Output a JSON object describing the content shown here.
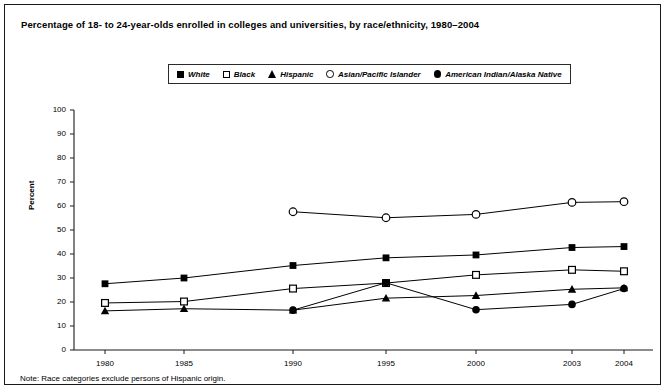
{
  "figure": {
    "title": "Percentage of 18- to 24-year-olds enrolled in colleges and universities, by race/ethnicity, 1980–2004",
    "note": "Note: Race categories exclude persons of Hispanic origin."
  },
  "legend": {
    "position": "top-center",
    "items": [
      {
        "label": "White",
        "marker": "filled-square-icon"
      },
      {
        "label": "Black",
        "marker": "open-square-icon"
      },
      {
        "label": "Hispanic",
        "marker": "filled-triangle-icon"
      },
      {
        "label": "Asian/Pacific Islander",
        "marker": "open-circle-icon"
      },
      {
        "label": "American Indian/Alaska Native",
        "marker": "filled-circle-icon"
      }
    ]
  },
  "axes": {
    "y_label": "Percent",
    "y_ticks": [
      "100",
      "90",
      "80",
      "70",
      "60",
      "50",
      "40",
      "30",
      "20",
      "10",
      "0"
    ],
    "x_ticks": [
      "1980",
      "1985",
      "1990",
      "1995",
      "2000",
      "2003",
      "2004"
    ]
  },
  "chart_data": {
    "type": "line",
    "title": "Percentage of 18- to 24-year-olds enrolled in colleges and universities, by race/ethnicity, 1980–2004",
    "xlabel": "",
    "ylabel": "Percent",
    "x": [
      1980,
      1985,
      1990,
      1995,
      2000,
      2003,
      2004
    ],
    "xlim": [
      1978,
      2005
    ],
    "ylim": [
      0,
      100
    ],
    "ytick_step": 10,
    "grid": false,
    "legend_position": "top-center",
    "annotations": [
      "Note: Race categories exclude persons of Hispanic origin."
    ],
    "series": [
      {
        "name": "White",
        "marker": "filled-square",
        "color": "#000000",
        "x": [
          1980,
          1985,
          1990,
          1995,
          2000,
          2003,
          2004
        ],
        "values": [
          27.6,
          30.0,
          35.2,
          38.4,
          39.6,
          42.7,
          43.1
        ]
      },
      {
        "name": "Black",
        "marker": "open-square",
        "color": "#000000",
        "x": [
          1980,
          1985,
          1990,
          1995,
          2000,
          2003,
          2004
        ],
        "values": [
          19.6,
          20.2,
          25.6,
          27.9,
          31.3,
          33.4,
          32.8
        ]
      },
      {
        "name": "Hispanic",
        "marker": "filled-triangle",
        "color": "#000000",
        "x": [
          1980,
          1985,
          1990,
          1995,
          2000,
          2003,
          2004
        ],
        "values": [
          16.3,
          17.2,
          16.6,
          21.6,
          22.7,
          25.3,
          25.9
        ]
      },
      {
        "name": "Asian/Pacific Islander",
        "marker": "open-circle",
        "color": "#000000",
        "x": [
          1990,
          1995,
          2000,
          2003,
          2004
        ],
        "values": [
          57.6,
          55.1,
          56.5,
          61.5,
          61.8
        ]
      },
      {
        "name": "American Indian/Alaska Native",
        "marker": "filled-circle",
        "color": "#000000",
        "x": [
          1990,
          1995,
          2000,
          2003,
          2004
        ],
        "values": [
          16.6,
          28.0,
          16.8,
          19.0,
          25.6
        ]
      }
    ]
  }
}
